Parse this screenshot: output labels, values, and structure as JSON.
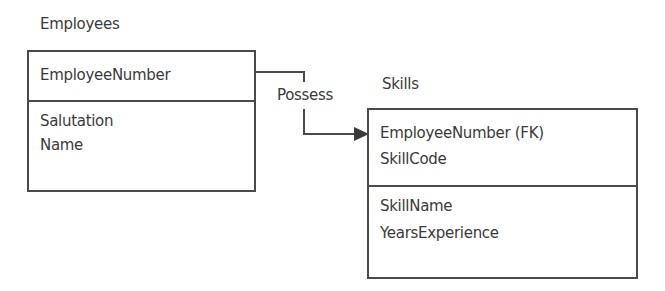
{
  "diagram": {
    "entities": [
      {
        "name": "Employees",
        "key_attributes": [
          "EmployeeNumber"
        ],
        "attributes": [
          "Salutation",
          "Name"
        ]
      },
      {
        "name": "Skills",
        "key_attributes": [
          "EmployeeNumber (FK)",
          "SkillCode"
        ],
        "attributes": [
          "SkillName",
          "YearsExperience"
        ]
      }
    ],
    "relationship": {
      "label": "Possess",
      "from": "Employees",
      "to": "Skills"
    },
    "colors": {
      "line": "#4a4a4a",
      "text": "#3a3a3a",
      "background": "#ffffff"
    }
  }
}
